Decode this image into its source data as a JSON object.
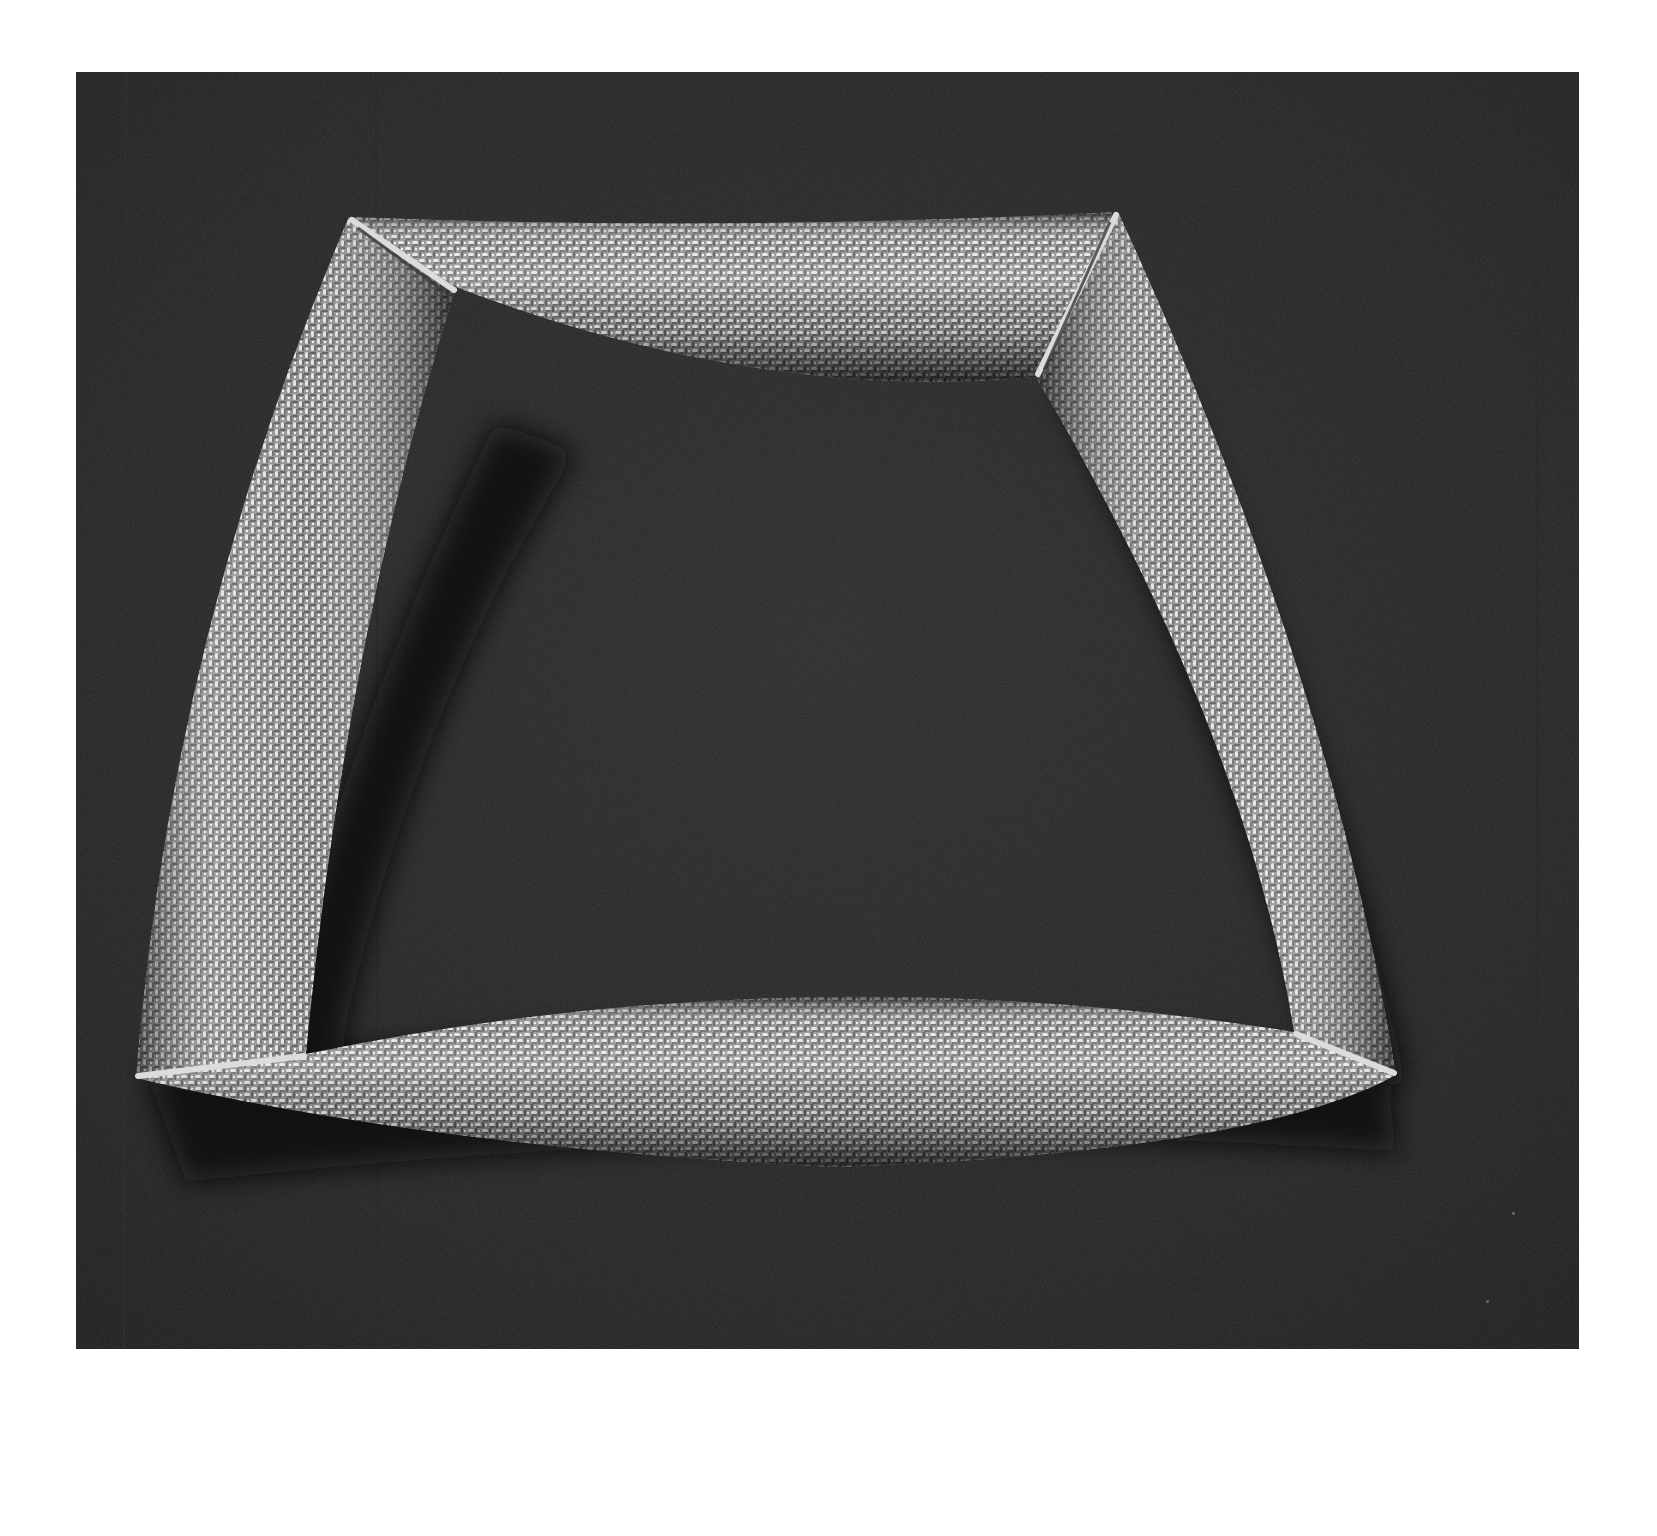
{
  "image": {
    "kind": "photograph",
    "style": "black-and-white studio product photo",
    "subject": "woven wire mesh bangle",
    "subject_shape": "trapezoid made of four curved tube segments joined with diagonal miter seams",
    "background": "dark textured backdrop inside a white page border",
    "colors": {
      "page": "#ffffff",
      "backdrop": "#232323",
      "shadow": "#0a0a0a",
      "metal_highlight": "#e8e8e8",
      "metal_mid": "#a9a9a9",
      "metal_dark": "#4a4a4a",
      "seam": "#d9d9d9"
    },
    "segments": [
      {
        "id": "top",
        "description": "short upper tube, gently bowed upward"
      },
      {
        "id": "left",
        "description": "long left tube sloping outward toward bottom"
      },
      {
        "id": "right",
        "description": "long right tube sloping outward toward bottom"
      },
      {
        "id": "bottom",
        "description": "long lower tube, curved, widest segment"
      }
    ],
    "visible_text": []
  }
}
